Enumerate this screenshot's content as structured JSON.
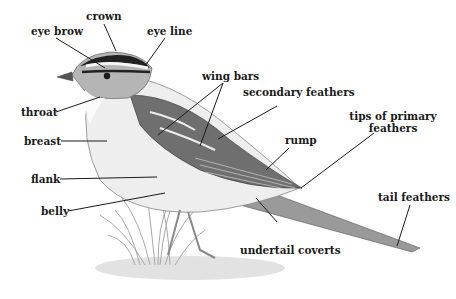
{
  "labels": {
    "crown": "crown",
    "eye_brow": "eye brow",
    "eye_line": "eye line",
    "wing_bars": "wing bars",
    "secondary_feathers": "secondary feathers",
    "tips_of_primary_feathers_1": "tips of primary",
    "tips_of_primary_feathers_2": "feathers",
    "rump": "rump",
    "throat": "throat",
    "breast": "breast",
    "flank": "flank",
    "belly": "belly",
    "tail_feathers": "tail feathers",
    "undertail_coverts": "undertail coverts"
  },
  "colors": {
    "text": "#1a1a1a",
    "leader_line": "#1a1a1a",
    "illustration_dark": "#333333",
    "illustration_mid": "#8a8a8a",
    "illustration_light": "#d6d6d6"
  }
}
